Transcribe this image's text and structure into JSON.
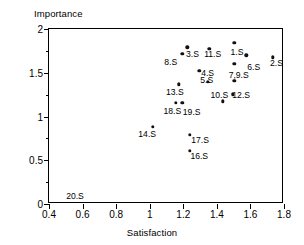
{
  "chart_data": {
    "type": "scatter",
    "title": "",
    "xlabel": "Satisfaction",
    "ylabel": "Importance",
    "xlim": [
      0.4,
      1.8
    ],
    "ylim": [
      0,
      2
    ],
    "xticks": [
      "0.4",
      "0.6",
      "0.8",
      "1",
      "1.2",
      "1.4",
      "1.6",
      "1.8"
    ],
    "xtick_values": [
      0.4,
      0.6,
      0.8,
      1.0,
      1.2,
      1.4,
      1.6,
      1.8
    ],
    "yticks": [
      "0",
      "0.5",
      "1",
      "1.5",
      "2"
    ],
    "ytick_values": [
      0,
      0.5,
      1.0,
      1.5,
      2.0
    ],
    "grid": false,
    "legend": "none",
    "minor_ticks": true,
    "marker": "filled-circle",
    "marker_color": "#111111",
    "points": [
      {
        "label": "3.S",
        "x": 1.225,
        "y": 1.79
      },
      {
        "label": "",
        "x": 1.195,
        "y": 1.715
      },
      {
        "label": "11.S",
        "x": 1.355,
        "y": 1.775
      },
      {
        "label": "1.S",
        "x": 1.505,
        "y": 1.84
      },
      {
        "label": "",
        "x": 1.575,
        "y": 1.7
      },
      {
        "label": "2.S",
        "x": 1.735,
        "y": 1.675
      },
      {
        "label": "6.S",
        "x": 1.505,
        "y": 1.6
      },
      {
        "label": "4.S",
        "x": 1.295,
        "y": 1.525
      },
      {
        "label": "5.S",
        "x": 1.345,
        "y": 1.395
      },
      {
        "label": "7,9.S",
        "x": 1.505,
        "y": 1.41
      },
      {
        "label": "13.S",
        "x": 1.175,
        "y": 1.37
      },
      {
        "label": "12.S",
        "x": 1.495,
        "y": 1.255
      },
      {
        "label": "10.S",
        "x": 1.435,
        "y": 1.175
      },
      {
        "label": "18.S",
        "x": 1.155,
        "y": 1.155
      },
      {
        "label": "",
        "x": 1.195,
        "y": 1.155
      },
      {
        "label": "14.S",
        "x": 1.02,
        "y": 0.885
      },
      {
        "label": "17.S",
        "x": 1.24,
        "y": 0.79
      },
      {
        "label": "16.S",
        "x": 1.24,
        "y": 0.61
      }
    ],
    "labels": [
      {
        "text": "3.S",
        "x": 1.255,
        "y": 1.715
      },
      {
        "text": "8.S",
        "x": 1.125,
        "y": 1.62
      },
      {
        "text": "11.S",
        "x": 1.375,
        "y": 1.71
      },
      {
        "text": "1.S",
        "x": 1.52,
        "y": 1.735
      },
      {
        "text": "2.S",
        "x": 1.755,
        "y": 1.61
      },
      {
        "text": "6.S",
        "x": 1.62,
        "y": 1.57
      },
      {
        "text": "4.S",
        "x": 1.345,
        "y": 1.5
      },
      {
        "text": "5.S",
        "x": 1.34,
        "y": 1.42
      },
      {
        "text": "7,9.S",
        "x": 1.53,
        "y": 1.48
      },
      {
        "text": "13.S",
        "x": 1.15,
        "y": 1.275
      },
      {
        "text": "12.S",
        "x": 1.545,
        "y": 1.25
      },
      {
        "text": "10.S",
        "x": 1.415,
        "y": 1.25
      },
      {
        "text": "18.S",
        "x": 1.135,
        "y": 1.065
      },
      {
        "text": "19.S",
        "x": 1.25,
        "y": 1.055
      },
      {
        "text": "14.S",
        "x": 0.985,
        "y": 0.8
      },
      {
        "text": "17.S",
        "x": 1.3,
        "y": 0.73
      },
      {
        "text": "16.S",
        "x": 1.295,
        "y": 0.545
      },
      {
        "text": "20.S",
        "x": 0.555,
        "y": 0.09
      }
    ]
  }
}
